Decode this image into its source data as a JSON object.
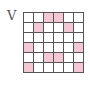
{
  "label": "V",
  "grid": {
    "rows": 6,
    "cols": 6,
    "fill_color": "#f5c6d3",
    "empty_color": "#ffffff",
    "line_color": "#555555",
    "cells": [
      [
        0,
        0,
        1,
        1,
        0,
        0
      ],
      [
        0,
        1,
        0,
        0,
        1,
        0
      ],
      [
        0,
        0,
        0,
        0,
        0,
        0
      ],
      [
        1,
        0,
        0,
        0,
        0,
        1
      ],
      [
        0,
        0,
        1,
        1,
        0,
        0
      ],
      [
        1,
        0,
        0,
        0,
        0,
        1
      ]
    ]
  }
}
